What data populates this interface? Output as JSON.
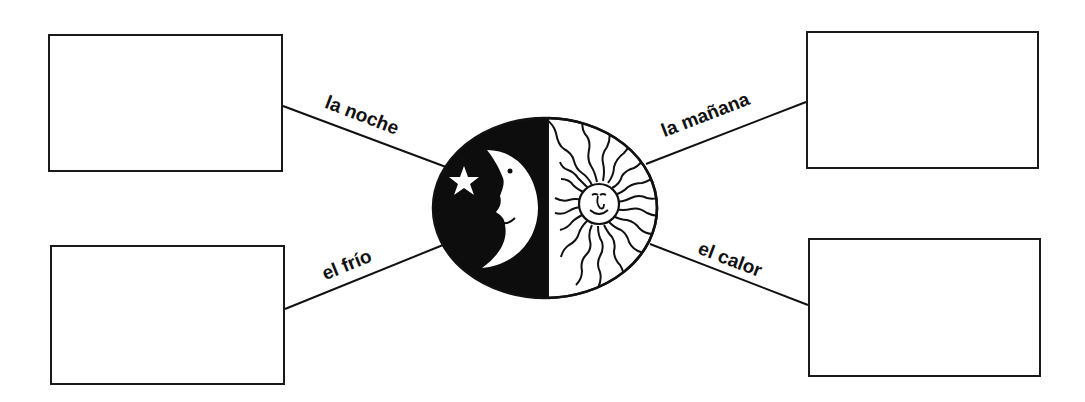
{
  "diagram": {
    "type": "word-web",
    "center": {
      "image": "moon-and-sun-icon",
      "left_half": "night-moon-with-star",
      "right_half": "day-sun-with-rays"
    },
    "branches": [
      {
        "position": "top-left",
        "label": "la noche",
        "answer_box": ""
      },
      {
        "position": "top-right",
        "label": "la mañana",
        "answer_box": ""
      },
      {
        "position": "bottom-left",
        "label": "el frío",
        "answer_box": ""
      },
      {
        "position": "bottom-right",
        "label": "el calor",
        "answer_box": ""
      }
    ]
  },
  "colors": {
    "ink": "#111111",
    "paper": "#ffffff"
  }
}
